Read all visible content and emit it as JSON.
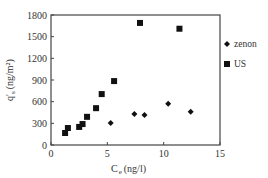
{
  "chart_data": {
    "type": "scatter",
    "title": "",
    "xlabel": "C e (ng/l)",
    "xlabel_main": "C",
    "xlabel_sub": "e",
    "xlabel_unit": "(ng/l)",
    "ylabel": "q's (ng/m²)",
    "ylabel_main": "q'",
    "ylabel_sub": "s",
    "ylabel_unit": "(ng/m²)",
    "xlim": [
      0,
      15
    ],
    "ylim": [
      0,
      1800
    ],
    "xticks": [
      0,
      5,
      10,
      15
    ],
    "yticks": [
      0,
      300,
      600,
      900,
      1200,
      1500,
      1800
    ],
    "grid": false,
    "legend_position": "right",
    "series": [
      {
        "name": "zenon",
        "marker": "diamond",
        "color": "#111111",
        "points": [
          {
            "x": 5.3,
            "y": 305
          },
          {
            "x": 7.4,
            "y": 430
          },
          {
            "x": 8.3,
            "y": 415
          },
          {
            "x": 10.4,
            "y": 570
          },
          {
            "x": 12.4,
            "y": 460
          }
        ]
      },
      {
        "name": "US",
        "marker": "square",
        "color": "#111111",
        "points": [
          {
            "x": 1.25,
            "y": 166
          },
          {
            "x": 1.5,
            "y": 235
          },
          {
            "x": 2.5,
            "y": 250
          },
          {
            "x": 2.8,
            "y": 290
          },
          {
            "x": 3.2,
            "y": 390
          },
          {
            "x": 4.0,
            "y": 510
          },
          {
            "x": 4.5,
            "y": 705
          },
          {
            "x": 5.6,
            "y": 885
          },
          {
            "x": 7.9,
            "y": 1690
          },
          {
            "x": 11.4,
            "y": 1610
          }
        ]
      }
    ]
  }
}
